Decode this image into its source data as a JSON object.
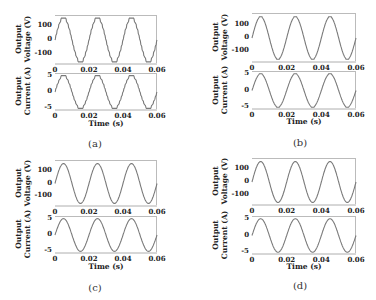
{
  "chart_data": [
    {
      "id": "a",
      "caption": "(a)",
      "type": "line",
      "waveform": "stepped",
      "subplots": [
        {
          "ylabel_line1": "Output",
          "ylabel_line2": "Voltage (V)",
          "yticks": [
            "100",
            "0",
            "-100"
          ],
          "ylim": [
            -170,
            170
          ],
          "amplitude": 155,
          "xticks": [
            "0",
            "0.02",
            "0.04",
            "0.06"
          ],
          "xlim": [
            0,
            0.06
          ],
          "xlabel": ""
        },
        {
          "ylabel_line1": "Output",
          "ylabel_line2": "Current (A)",
          "yticks": [
            "5",
            "0",
            "-5"
          ],
          "ylim": [
            -5.5,
            5.5
          ],
          "amplitude": 5,
          "xticks": [
            "0",
            "0.02",
            "0.04",
            "0.06"
          ],
          "xlim": [
            0,
            0.06
          ],
          "xlabel": "Time (s)"
        }
      ],
      "frequency_hz": 50
    },
    {
      "id": "b",
      "caption": "(b)",
      "type": "line",
      "waveform": "sine-slight-steps",
      "subplots": [
        {
          "ylabel_line1": "Output",
          "ylabel_line2": "Voltage (V)",
          "yticks": [
            "100",
            "0",
            "-100"
          ],
          "ylim": [
            -180,
            180
          ],
          "amplitude": 160,
          "xticks": [
            "0",
            "0.02",
            "0.04",
            "0.06"
          ],
          "xlim": [
            0,
            0.06
          ],
          "xlabel": ""
        },
        {
          "ylabel_line1": "Output",
          "ylabel_line2": "Current (A)",
          "yticks": [
            "5",
            "0",
            "-5"
          ],
          "ylim": [
            -5.5,
            5.5
          ],
          "amplitude": 5,
          "xticks": [
            "0",
            "0.02",
            "0.04",
            "0.06"
          ],
          "xlim": [
            0,
            0.06
          ],
          "xlabel": "Time (s)"
        }
      ],
      "frequency_hz": 50
    },
    {
      "id": "c",
      "caption": "(c)",
      "type": "line",
      "waveform": "sine",
      "subplots": [
        {
          "ylabel_line1": "Output",
          "ylabel_line2": "Voltage (V)",
          "yticks": [
            "100",
            "0",
            "-100"
          ],
          "ylim": [
            -180,
            180
          ],
          "amplitude": 160,
          "xticks": [
            "0",
            "0.02",
            "0.04",
            "0.06"
          ],
          "xlim": [
            0,
            0.06
          ],
          "xlabel": ""
        },
        {
          "ylabel_line1": "Output",
          "ylabel_line2": "Current (A)",
          "yticks": [
            "5",
            "0",
            "-5"
          ],
          "ylim": [
            -5.5,
            5.5
          ],
          "amplitude": 5,
          "xticks": [
            "0",
            "0.02",
            "0.04",
            "0.06"
          ],
          "xlim": [
            0,
            0.06
          ],
          "xlabel": "Time (s)"
        }
      ],
      "frequency_hz": 50
    },
    {
      "id": "d",
      "caption": "(d)",
      "type": "line",
      "waveform": "sine",
      "subplots": [
        {
          "ylabel_line1": "Output",
          "ylabel_line2": "Voltage (V)",
          "yticks": [
            "100",
            "0",
            "-100"
          ],
          "ylim": [
            -180,
            180
          ],
          "amplitude": 160,
          "xticks": [
            "0",
            "0.02",
            "0.04",
            "0.06"
          ],
          "xlim": [
            0,
            0.06
          ],
          "xlabel": ""
        },
        {
          "ylabel_line1": "Output",
          "ylabel_line2": "Current (A)",
          "yticks": [
            "5",
            "0",
            "-5"
          ],
          "ylim": [
            -5.5,
            5.5
          ],
          "amplitude": 5,
          "xticks": [
            "0",
            "0.02",
            "0.04",
            "0.06"
          ],
          "xlim": [
            0,
            0.06
          ],
          "xlabel": "Time (s)"
        }
      ],
      "frequency_hz": 50
    }
  ],
  "style": {
    "line_color": "#7a7a7a",
    "frame_color": "#bbbbbb"
  }
}
